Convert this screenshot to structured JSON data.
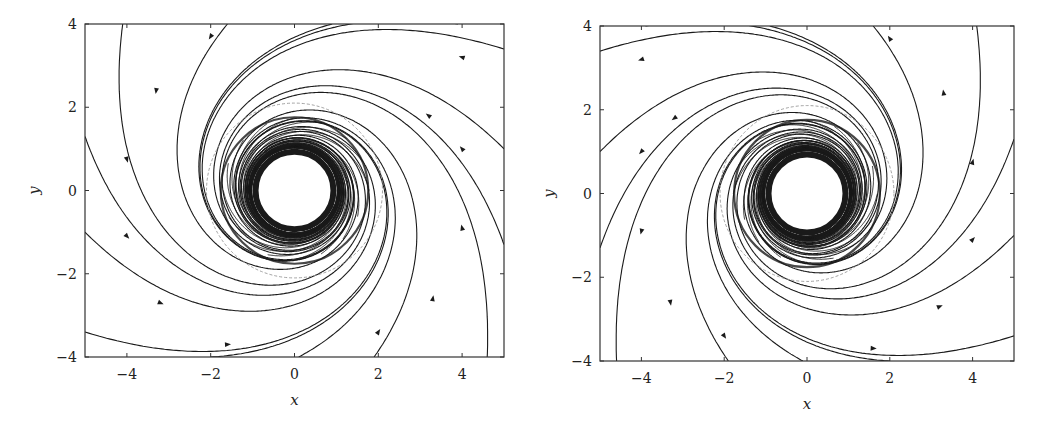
{
  "figure": {
    "background": "#ffffff",
    "line_color": "#1a1a1a",
    "dashed_color": "#999999"
  },
  "chart_data": [
    {
      "type": "line",
      "subtype": "phase-portrait",
      "title": "",
      "xlabel": "x",
      "ylabel": "y",
      "xlim": [
        -5,
        5
      ],
      "ylim": [
        -4,
        4
      ],
      "xticks": [
        -4,
        -2,
        0,
        2,
        4
      ],
      "yticks": [
        -4,
        -2,
        0,
        2,
        4
      ],
      "xtick_labels": [
        "−4",
        "−2",
        "0",
        "2",
        "4"
      ],
      "ytick_labels": [
        "−4",
        "−2",
        "0",
        "2",
        "4"
      ],
      "grid": false,
      "legend": null,
      "frame_px": {
        "left": 85,
        "top": 24,
        "right": 504,
        "bottom": 357
      },
      "flow": "inward",
      "rotation": "counterclockwise",
      "inner_circle_radius": 1.0,
      "spiral_band_outer_radius": 1.8,
      "dashed_circle_radius": 2.1,
      "trajectory_starts": [
        [
          -4.1,
          4.0
        ],
        [
          -1.6,
          4.0
        ],
        [
          0.9,
          4.0
        ],
        [
          3.9,
          4.0
        ],
        [
          5.0,
          3.4
        ],
        [
          5.0,
          1.0
        ],
        [
          5.0,
          -1.3
        ],
        [
          4.6,
          -4.0
        ],
        [
          1.9,
          -4.0
        ],
        [
          0.1,
          -4.0
        ],
        [
          -2.0,
          -4.0
        ],
        [
          -5.0,
          -3.4
        ],
        [
          -5.0,
          -1.0
        ],
        [
          -5.0,
          1.3
        ]
      ],
      "arrow_points": [
        [
          -3.3,
          2.4
        ],
        [
          -2.0,
          3.7
        ],
        [
          3.2,
          1.8
        ],
        [
          4.0,
          3.2
        ],
        [
          4.0,
          1.0
        ],
        [
          4.0,
          -0.9
        ],
        [
          3.3,
          -2.6
        ],
        [
          2.0,
          -3.4
        ],
        [
          -1.6,
          -3.7
        ],
        [
          -3.2,
          -2.7
        ],
        [
          -4.0,
          -1.1
        ],
        [
          -4.0,
          0.75
        ]
      ]
    },
    {
      "type": "line",
      "subtype": "phase-portrait",
      "title": "",
      "xlabel": "x",
      "ylabel": "y",
      "xlim": [
        -5,
        5
      ],
      "ylim": [
        -4,
        4
      ],
      "xticks": [
        -4,
        -2,
        0,
        2,
        4
      ],
      "yticks": [
        -4,
        -2,
        0,
        2,
        4
      ],
      "xtick_labels": [
        "−4",
        "−2",
        "0",
        "2",
        "4"
      ],
      "ytick_labels": [
        "−4",
        "−2",
        "0",
        "2",
        "4"
      ],
      "grid": false,
      "legend": null,
      "frame_px": {
        "left": 600,
        "top": 26,
        "right": 1014,
        "bottom": 361
      },
      "flow": "outward",
      "rotation": "clockwise",
      "inner_circle_radius": 1.0,
      "spiral_band_outer_radius": 1.8,
      "dashed_circle_radius": 2.1,
      "trajectory_starts": [
        [
          4.1,
          4.0
        ],
        [
          1.6,
          4.0
        ],
        [
          -0.9,
          4.0
        ],
        [
          -3.9,
          4.0
        ],
        [
          -5.0,
          3.4
        ],
        [
          -5.0,
          1.0
        ],
        [
          -5.0,
          -1.3
        ],
        [
          -4.6,
          -4.0
        ],
        [
          -1.9,
          -4.0
        ],
        [
          -0.1,
          -4.0
        ],
        [
          2.0,
          -4.0
        ],
        [
          5.0,
          -3.4
        ],
        [
          5.0,
          -1.0
        ],
        [
          5.0,
          1.3
        ]
      ],
      "arrow_points": [
        [
          3.3,
          2.4
        ],
        [
          2.0,
          3.7
        ],
        [
          -3.2,
          1.8
        ],
        [
          -4.0,
          3.2
        ],
        [
          -4.0,
          1.0
        ],
        [
          -4.0,
          -0.9
        ],
        [
          -3.3,
          -2.6
        ],
        [
          -2.0,
          -3.4
        ],
        [
          1.6,
          -3.7
        ],
        [
          3.2,
          -2.7
        ],
        [
          4.0,
          -1.1
        ],
        [
          4.0,
          0.75
        ]
      ]
    }
  ]
}
